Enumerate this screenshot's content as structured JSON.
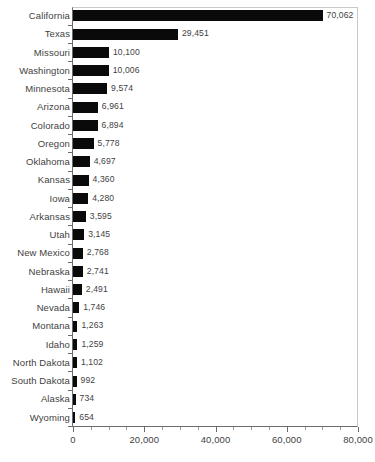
{
  "chart_data": {
    "type": "bar",
    "orientation": "horizontal",
    "title": "",
    "subtitle": "",
    "xlabel": "",
    "ylabel": "",
    "xlim": [
      0,
      80000
    ],
    "ylim": null,
    "grid": false,
    "legend": null,
    "bar_color": "#0a0a0a",
    "text_color": "#3f3f3f",
    "axis_color": "#6b6b6b",
    "frame_color": "#c9c9c9",
    "background": "#ffffff",
    "xticks": [
      0,
      20000,
      40000,
      60000,
      80000
    ],
    "xtick_labels": [
      "0",
      "20,000",
      "40,000",
      "60,000",
      "80,000"
    ],
    "xminor_step": 5000,
    "categories": [
      "California",
      "Texas",
      "Missouri",
      "Washington",
      "Minnesota",
      "Arizona",
      "Colorado",
      "Oregon",
      "Oklahoma",
      "Kansas",
      "Iowa",
      "Arkansas",
      "Utah",
      "New Mexico",
      "Nebraska",
      "Hawaii",
      "Nevada",
      "Montana",
      "Idaho",
      "North Dakota",
      "South Dakota",
      "Alaska",
      "Wyoming"
    ],
    "values": [
      70062,
      29451,
      10100,
      10006,
      9574,
      6961,
      6894,
      5778,
      4697,
      4360,
      4280,
      3595,
      3145,
      2768,
      2741,
      2491,
      1746,
      1263,
      1259,
      1102,
      992,
      734,
      654
    ],
    "value_labels": [
      "70,062",
      "29,451",
      "10,100",
      "10,006",
      "9,574",
      "6,961",
      "6,894",
      "5,778",
      "4,697",
      "4,360",
      "4,280",
      "3,595",
      "3,145",
      "2,768",
      "2,741",
      "2,491",
      "1,746",
      "1,263",
      "1,259",
      "1,102",
      "992",
      "734",
      "654"
    ]
  }
}
